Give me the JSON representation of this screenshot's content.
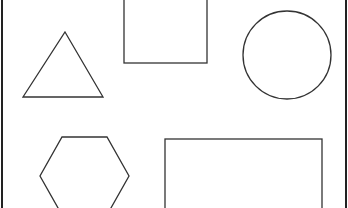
{
  "canvas": {
    "width": 348,
    "height": 208,
    "background": "#ffffff",
    "stroke_color": "#333333"
  },
  "shapes": [
    {
      "type": "triangle",
      "label": "triangle",
      "points": [
        [
          65,
          32
        ],
        [
          103,
          97
        ],
        [
          23,
          97
        ]
      ]
    },
    {
      "type": "square",
      "label": "square",
      "x": 124,
      "y": -20,
      "width": 83,
      "height": 83
    },
    {
      "type": "circle",
      "label": "circle",
      "cx": 287,
      "cy": 55,
      "r": 44
    },
    {
      "type": "hexagon",
      "label": "hexagon",
      "points": [
        [
          62,
          137
        ],
        [
          107,
          137
        ],
        [
          129,
          176
        ],
        [
          107,
          215
        ],
        [
          62,
          215
        ],
        [
          40,
          176
        ]
      ]
    },
    {
      "type": "rectangle",
      "label": "rectangle",
      "x": 165,
      "y": 139,
      "width": 157,
      "height": 90
    }
  ],
  "frame": {
    "left_x": 2,
    "right_x": 346
  }
}
